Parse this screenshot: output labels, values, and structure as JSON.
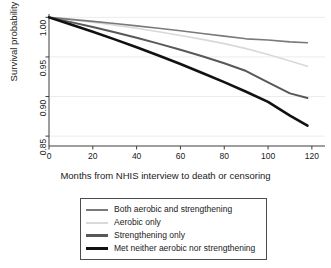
{
  "chart_data": {
    "type": "line",
    "title": "",
    "xlabel": "Months from NHIS interview to death or censoring",
    "ylabel": "Survival probability",
    "xlim": [
      0,
      126
    ],
    "ylim": [
      0.8375,
      1.003
    ],
    "xticks": [
      0,
      20,
      40,
      60,
      80,
      100,
      120
    ],
    "yticks": [
      0.85,
      0.9,
      0.95,
      1.0
    ],
    "xtick_labels": [
      "0",
      "20",
      "40",
      "60",
      "80",
      "100",
      "120"
    ],
    "ytick_labels": [
      "0.85",
      "0.90",
      "0.95",
      "1.00"
    ],
    "grid": "horizontal",
    "legend_position": "below-plot",
    "x": [
      0,
      10,
      20,
      30,
      40,
      50,
      60,
      70,
      80,
      90,
      100,
      110,
      118
    ],
    "series": [
      {
        "name": "Both aerobic and strengthening",
        "color": "#7a7a7a",
        "width": 1.6,
        "values": [
          1.0,
          0.9975,
          0.995,
          0.9922,
          0.9893,
          0.9862,
          0.983,
          0.9797,
          0.9763,
          0.9729,
          0.9715,
          0.969,
          0.968
        ]
      },
      {
        "name": "Aerobic only",
        "color": "#d9d9d9",
        "width": 1.6,
        "values": [
          1.0,
          0.997,
          0.9938,
          0.9902,
          0.9862,
          0.9818,
          0.9772,
          0.9722,
          0.9668,
          0.9605,
          0.953,
          0.945,
          0.9382
        ]
      },
      {
        "name": "Strengthening only",
        "color": "#585858",
        "width": 2.0,
        "values": [
          1.0,
          0.994,
          0.9878,
          0.9812,
          0.9742,
          0.9668,
          0.959,
          0.9508,
          0.942,
          0.9322,
          0.918,
          0.904,
          0.8982
        ]
      },
      {
        "name": "Met neither aerobic nor strengthening",
        "color": "#111111",
        "width": 2.6,
        "values": [
          1.0,
          0.991,
          0.9818,
          0.9722,
          0.9622,
          0.9518,
          0.941,
          0.9298,
          0.9182,
          0.906,
          0.8932,
          0.876,
          0.8632
        ]
      }
    ]
  },
  "legend": {
    "items": [
      {
        "label": "Both aerobic and strengthening",
        "color": "#7a7a7a",
        "thickness": "2px"
      },
      {
        "label": "Aerobic only",
        "color": "#d9d9d9",
        "thickness": "2px"
      },
      {
        "label": "Strengthening only",
        "color": "#585858",
        "thickness": "2.5px"
      },
      {
        "label": "Met neither aerobic nor strengthening",
        "color": "#111111",
        "thickness": "3px"
      }
    ]
  },
  "axes": {
    "axis_color": "#3d3d3d",
    "grid_color": "#ececec"
  }
}
